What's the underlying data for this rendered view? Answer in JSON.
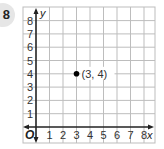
{
  "problem": {
    "number": "8"
  },
  "chart_data": {
    "type": "scatter",
    "title": "",
    "xlabel": "x",
    "ylabel": "y",
    "origin_label": "O",
    "xlim": [
      0,
      8
    ],
    "ylim": [
      0,
      8
    ],
    "x_ticks": [
      "1",
      "2",
      "3",
      "4",
      "5",
      "6",
      "7",
      "8"
    ],
    "y_ticks": [
      "1",
      "2",
      "3",
      "4",
      "5",
      "6",
      "7",
      "8"
    ],
    "grid": true,
    "points": [
      {
        "x": 3,
        "y": 4,
        "label": "(3, 4)"
      }
    ]
  },
  "colors": {
    "grid": "#bdbdbd",
    "axis": "#222222",
    "point": "#000000",
    "badge": "#e6e6e6"
  }
}
